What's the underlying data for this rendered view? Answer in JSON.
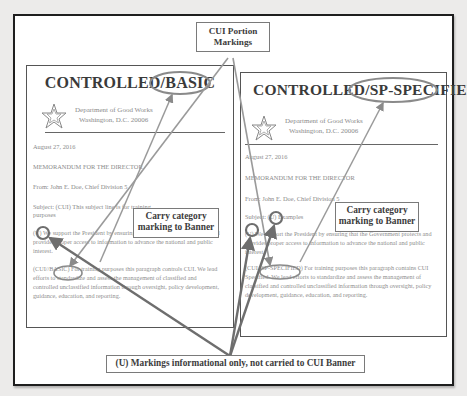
{
  "callouts": {
    "portion_markings": [
      "CUI Portion",
      "Markings"
    ],
    "carry_category_left": [
      "Carry category",
      "marking to Banner"
    ],
    "carry_category_right": [
      "Carry category",
      "marking to Banner"
    ],
    "u_markings": "(U) Markings informational only, not carried to CUI Banner"
  },
  "documents": [
    {
      "banner_prefix": "CONTROLLED",
      "banner_category": "/BASIC",
      "department": "Department of Good Works",
      "address": "Washington, D.C. 20006",
      "date": "August 27, 2016",
      "memo": "MEMORANDUM FOR THE DIRECTOR",
      "from": "From: John E. Doe, Chief Division 5",
      "subject": "Subject: (CUI) This subject line is for training",
      "subject_cont": "purposes",
      "para1_marking": "(U)",
      "para1": "We support the President by ensuring that the Government protects and provides proper access to information to advance the national and public interest.",
      "para2_marking": "(CUI//BASIC)",
      "para2": "For training purposes this paragraph controls CUI. We lead efforts to standardize and assess the management of classified and controlled unclassified information through oversight, policy development, guidance, education, and reporting."
    },
    {
      "banner_prefix": "CONTROLLED",
      "banner_category": "/SP-SPECIFIED",
      "department": "Department of Good Works",
      "address": "Washington, D.C. 20006",
      "date": "August 27, 2016",
      "memo": "MEMORANDUM FOR THE DIRECTOR",
      "from": "From: John E. Doe, Chief Division 5",
      "subject_prefix": "Subject:",
      "subject_marking": "(U)",
      "subject_rest": "Examples",
      "para1_marking": "(U)",
      "para1": "We support the President by ensuring that the Government protects and provides proper access to information to advance the national and public interest.",
      "para2_marking": "(CUI//SP-SPECIFIED)",
      "para2": "For training purposes this paragraph contains CUI Specified. We lead efforts to standardize and assess the management of classified and controlled unclassified information through oversight, policy development, guidance, education, and reporting."
    }
  ],
  "colors": {
    "annotation": "#8a8a8a",
    "annotation_dark": "#6e6e6e",
    "frame": "#1e1e1e"
  }
}
